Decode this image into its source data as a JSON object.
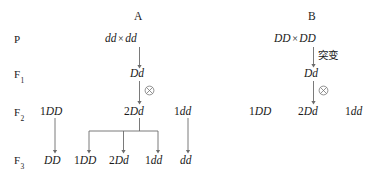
{
  "diagram": {
    "type": "genetics-inheritance-pedigree",
    "background_color": "#ffffff",
    "line_color": "#6b6b6b",
    "text_color": "#1a1a1a"
  },
  "generation_labels": [
    {
      "name": "P",
      "base": "P",
      "sub": ""
    },
    {
      "name": "F1",
      "base": "F",
      "sub": "1"
    },
    {
      "name": "F2",
      "base": "F",
      "sub": "2"
    },
    {
      "name": "F3",
      "base": "F",
      "sub": "3"
    }
  ],
  "panels": [
    {
      "id": "A",
      "title": "A",
      "rows": {
        "P": {
          "left": "dd",
          "operator": "×",
          "right": "dd"
        },
        "F1": {
          "genotype": "Dd",
          "selfing_symbol": "⊗"
        },
        "F2": [
          {
            "ratio": "1",
            "genotype": "DD"
          },
          {
            "ratio": "2",
            "genotype": "Dd",
            "selfing_symbol": "⊗"
          },
          {
            "ratio": "1",
            "genotype": "dd"
          }
        ],
        "F3": [
          {
            "ratio": "",
            "genotype": "DD"
          },
          {
            "ratio": "1",
            "genotype": "DD"
          },
          {
            "ratio": "2",
            "genotype": "Dd"
          },
          {
            "ratio": "1",
            "genotype": "dd"
          },
          {
            "ratio": "",
            "genotype": "dd"
          }
        ]
      }
    },
    {
      "id": "B",
      "title": "B",
      "rows": {
        "P": {
          "left": "DD",
          "operator": "×",
          "right": "DD"
        },
        "mutation_label": "突变",
        "F1": {
          "genotype": "Dd",
          "selfing_symbol": "⊗"
        },
        "F2": [
          {
            "ratio": "1",
            "genotype": "DD"
          },
          {
            "ratio": "2",
            "genotype": "Dd"
          },
          {
            "ratio": "1",
            "genotype": "dd"
          }
        ],
        "F3": []
      }
    }
  ]
}
